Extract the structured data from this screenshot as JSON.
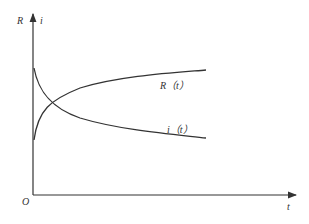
{
  "diagram": {
    "axes": {
      "y_labels": [
        "R",
        "i"
      ],
      "x_label": "t",
      "origin_label": "O"
    },
    "curves": [
      {
        "name": "R(t)",
        "label": "R（t）",
        "behavior": "rises from low value and saturates"
      },
      {
        "name": "i(t)",
        "label": "i（t）",
        "behavior": "decays from high value and levels off"
      }
    ],
    "colors": {
      "line": "#333333",
      "background": "#ffffff"
    }
  }
}
